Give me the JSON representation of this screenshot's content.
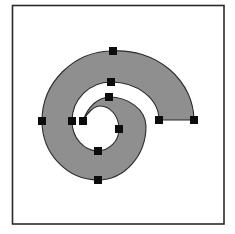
{
  "diagram": {
    "type": "spiral-shape-with-control-points",
    "frame": {
      "x": 12,
      "y": 5,
      "width": 212,
      "height": 219,
      "stroke": "#2a2a2a"
    },
    "shape": {
      "fill": "#8f8f8f",
      "stroke": "#2b2b2b"
    },
    "handle_size": 8,
    "handle_color": "#0c0c0c",
    "handles": [
      {
        "id": "outer-top",
        "x": 113,
        "y": 51
      },
      {
        "id": "middle-top",
        "x": 111,
        "y": 82
      },
      {
        "id": "inner-top",
        "x": 109,
        "y": 97
      },
      {
        "id": "outer-left",
        "x": 42,
        "y": 121
      },
      {
        "id": "middle-left",
        "x": 72,
        "y": 121
      },
      {
        "id": "inner-tip",
        "x": 83,
        "y": 121
      },
      {
        "id": "inner-right",
        "x": 119,
        "y": 129
      },
      {
        "id": "inner-bottom",
        "x": 98,
        "y": 151
      },
      {
        "id": "outer-bottom",
        "x": 98,
        "y": 180
      },
      {
        "id": "end-inner",
        "x": 159,
        "y": 120
      },
      {
        "id": "end-outer",
        "x": 194,
        "y": 120
      }
    ]
  }
}
